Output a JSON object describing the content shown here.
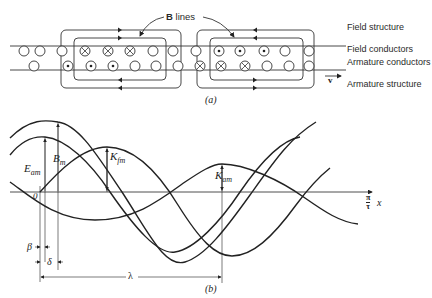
{
  "part_a": {
    "caption": "(a)",
    "b_lines_label_bold": "B",
    "b_lines_label_rest": " lines",
    "velocity_label": "v",
    "labels": {
      "field_structure": "Field structure",
      "field_conductors": "Field conductors",
      "armature_conductors": "Armature conductors",
      "armature_structure": "Armature structure"
    },
    "field_conductors": [
      {
        "x": 24,
        "sym": "empty"
      },
      {
        "x": 40,
        "sym": "empty"
      },
      {
        "x": 62,
        "sym": "empty"
      },
      {
        "x": 85,
        "sym": "cross"
      },
      {
        "x": 108,
        "sym": "cross"
      },
      {
        "x": 130,
        "sym": "cross"
      },
      {
        "x": 153,
        "sym": "empty"
      },
      {
        "x": 173,
        "sym": "empty"
      },
      {
        "x": 196,
        "sym": "empty"
      },
      {
        "x": 219,
        "sym": "dot"
      },
      {
        "x": 240,
        "sym": "dot"
      },
      {
        "x": 264,
        "sym": "dot"
      },
      {
        "x": 285,
        "sym": "empty"
      },
      {
        "x": 309,
        "sym": "empty"
      }
    ],
    "armature_conductors": [
      {
        "x": 34,
        "sym": "empty"
      },
      {
        "x": 68,
        "sym": "dot"
      },
      {
        "x": 91,
        "sym": "dot"
      },
      {
        "x": 113,
        "sym": "dot"
      },
      {
        "x": 135,
        "sym": "empty"
      },
      {
        "x": 156,
        "sym": "empty"
      },
      {
        "x": 178,
        "sym": "empty"
      },
      {
        "x": 200,
        "sym": "cross"
      },
      {
        "x": 221,
        "sym": "cross"
      },
      {
        "x": 245,
        "sym": "cross"
      },
      {
        "x": 267,
        "sym": "empty"
      },
      {
        "x": 289,
        "sym": "empty"
      },
      {
        "x": 309,
        "sym": "empty"
      }
    ]
  },
  "part_b": {
    "caption": "(b)",
    "origin_label": "0",
    "x_axis_label_num": "π",
    "x_axis_label_den": "τ",
    "x_axis_var": "x",
    "curve_labels": {
      "B": {
        "main": "B",
        "sub": "m"
      },
      "E": {
        "main": "E",
        "sub": "am"
      },
      "Kf": {
        "main": "K",
        "sub": "fm"
      },
      "Ka": {
        "main": "K",
        "sub": "am"
      }
    },
    "dimension_labels": {
      "beta": "β",
      "delta": "δ",
      "lambda": "λ"
    }
  },
  "chart_data": {
    "type": "line",
    "title": "",
    "xlabel": "(π/τ) x",
    "ylabel": "",
    "grid": false,
    "series": [
      {
        "name": "B (amplitude B_m)",
        "shape": "sinusoid",
        "peak_phase": "δ",
        "relative_amplitude": 1.0
      },
      {
        "name": "E_a (amplitude E_am)",
        "shape": "sinusoid",
        "peak_phase": "β",
        "relative_amplitude": 0.78
      },
      {
        "name": "K_f (amplitude K_fm)",
        "shape": "sinusoid",
        "peak_phase": "π/2 - leading",
        "relative_amplitude": 0.65
      },
      {
        "name": "K_a (amplitude K_am)",
        "shape": "sinusoid",
        "peak_phase": "λ",
        "relative_amplitude": 0.4
      }
    ],
    "annotations": [
      "β",
      "δ",
      "λ",
      "0"
    ]
  }
}
